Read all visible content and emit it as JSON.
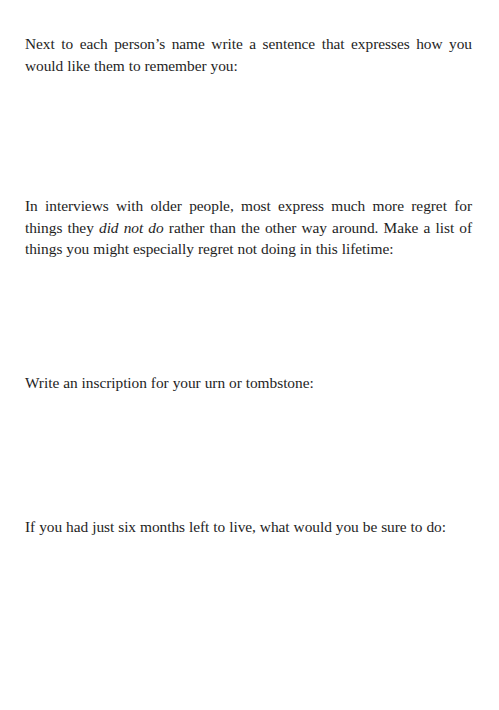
{
  "prompts": [
    {
      "id": "remember",
      "text": "Next to each person’s name write a sentence that expresses how you would like them to remember you:"
    },
    {
      "id": "regret",
      "text_before": "In interviews with older people, most express much more regret for things they ",
      "text_emphasis": "did not do",
      "text_after": " rather than the other way around. Make a list of things you might especially regret not doing in this lifetime:"
    },
    {
      "id": "inscription",
      "text": "Write an inscription for your urn or tombstone:"
    },
    {
      "id": "six-months",
      "text": "If you had just six months left to live, what would you be sure to do:"
    }
  ]
}
